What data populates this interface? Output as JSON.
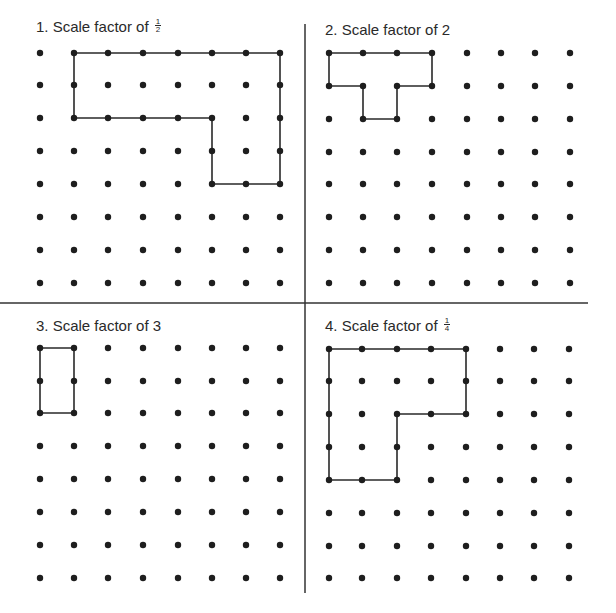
{
  "panels": [
    {
      "id": 1,
      "title_prefix": "1. Scale factor of ",
      "fraction": {
        "num": "1",
        "den": "2"
      },
      "title_x": 36,
      "title_y": 18,
      "xs": [
        40,
        74,
        108,
        143,
        178,
        212,
        246,
        280
      ],
      "ys": [
        53,
        85,
        118,
        151,
        184,
        217,
        250,
        283
      ],
      "shape": [
        [
          1,
          0
        ],
        [
          7,
          0
        ],
        [
          7,
          4
        ],
        [
          5,
          4
        ],
        [
          5,
          2
        ],
        [
          1,
          2
        ]
      ]
    },
    {
      "id": 2,
      "title_prefix": "2. Scale factor of 2",
      "fraction": null,
      "title_x": 325,
      "title_y": 21,
      "xs": [
        329,
        363,
        397,
        432,
        467,
        501,
        535,
        570
      ],
      "ys": [
        53,
        86,
        119,
        152,
        184,
        217,
        250,
        283
      ],
      "shape": [
        [
          0,
          0
        ],
        [
          3,
          0
        ],
        [
          3,
          1
        ],
        [
          2,
          1
        ],
        [
          2,
          2
        ],
        [
          1,
          2
        ],
        [
          1,
          1
        ],
        [
          0,
          1
        ]
      ]
    },
    {
      "id": 3,
      "title_prefix": "3. Scale factor of 3",
      "fraction": null,
      "title_x": 36,
      "title_y": 317,
      "xs": [
        40,
        74,
        108,
        143,
        178,
        212,
        246,
        280
      ],
      "ys": [
        348,
        381,
        413,
        446,
        479,
        512,
        545,
        578
      ],
      "shape": [
        [
          0,
          0
        ],
        [
          1,
          0
        ],
        [
          1,
          2
        ],
        [
          0,
          2
        ]
      ]
    },
    {
      "id": 4,
      "title_prefix": "4. Scale factor of ",
      "fraction": {
        "num": "1",
        "den": "4"
      },
      "title_x": 325,
      "title_y": 317,
      "xs": [
        329,
        362,
        397,
        431,
        466,
        500,
        534,
        569
      ],
      "ys": [
        349,
        381,
        414,
        447,
        480,
        513,
        546,
        578
      ],
      "shape": [
        [
          0,
          0
        ],
        [
          4,
          0
        ],
        [
          4,
          2
        ],
        [
          2,
          2
        ],
        [
          2,
          4
        ],
        [
          0,
          4
        ]
      ]
    }
  ],
  "dividers": {
    "vertical": {
      "x": 305,
      "y1": 24,
      "y2": 593
    },
    "horizontal": {
      "y": 303,
      "x1": 0,
      "x2": 588
    }
  },
  "colors": {
    "dot": "#1e1e1e",
    "line": "#2a2a2a",
    "divider": "#333333"
  }
}
